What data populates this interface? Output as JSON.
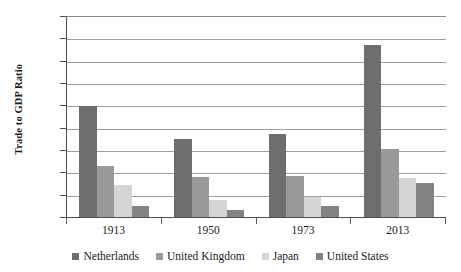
{
  "chart_data": {
    "type": "bar",
    "title": "",
    "subtitle": "",
    "xlabel": "",
    "ylabel": "Trade to GDP Ratio",
    "categories": [
      "1913",
      "1950",
      "1973",
      "2013"
    ],
    "series": [
      {
        "name": "Netherlands",
        "values": [
          100,
          71,
          75,
          155
        ],
        "color": "#6e6e6e"
      },
      {
        "name": "United Kingdom",
        "values": [
          47,
          37,
          38,
          62
        ],
        "color": "#9a9a9a"
      },
      {
        "name": "Japan",
        "values": [
          30,
          16,
          19,
          36
        ],
        "color": "#d5d5d5"
      },
      {
        "name": "United States",
        "values": [
          11,
          7,
          11,
          31
        ],
        "color": "#838383"
      }
    ],
    "ylim": [
      0,
      180
    ],
    "yticks": [
      0,
      20,
      40,
      60,
      80,
      100,
      120,
      140,
      160,
      180
    ],
    "ytick_labels": [
      "0",
      "20",
      "40",
      "60",
      "80",
      "100",
      "120",
      "140",
      "160",
      "180"
    ],
    "grid": "horizontal",
    "legend_position": "bottom",
    "annotations": []
  },
  "legend": {
    "items": [
      {
        "label": "Netherlands"
      },
      {
        "label": "United Kingdom"
      },
      {
        "label": "Japan"
      },
      {
        "label": "United States"
      }
    ]
  }
}
